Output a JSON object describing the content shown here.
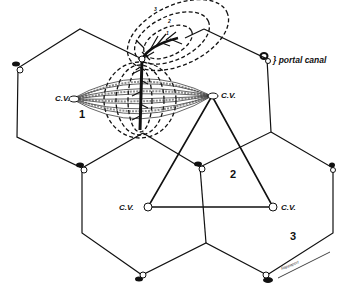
{
  "diagram": {
    "type": "liver acinus / hexagonal lobule schematic",
    "labels": {
      "central_vein": "C.V.",
      "portal_canal": "} portal canal",
      "zone_1": "1",
      "zone_2": "2",
      "zone_3": "3",
      "acinus_zone_1": "1",
      "acinus_zone_2": "2",
      "acinus_zone_3": "3",
      "signature": "Rappaport"
    },
    "central_veins": [
      {
        "id": "cv-top-left",
        "label": "C.V."
      },
      {
        "id": "cv-top-right",
        "label": "C.V."
      },
      {
        "id": "cv-bottom-left",
        "label": "C.V."
      },
      {
        "id": "cv-bottom-right",
        "label": "C.V."
      }
    ],
    "region_numbers": [
      "1",
      "2",
      "3"
    ],
    "colors": {
      "line": "#111111",
      "background": "#ffffff"
    }
  }
}
